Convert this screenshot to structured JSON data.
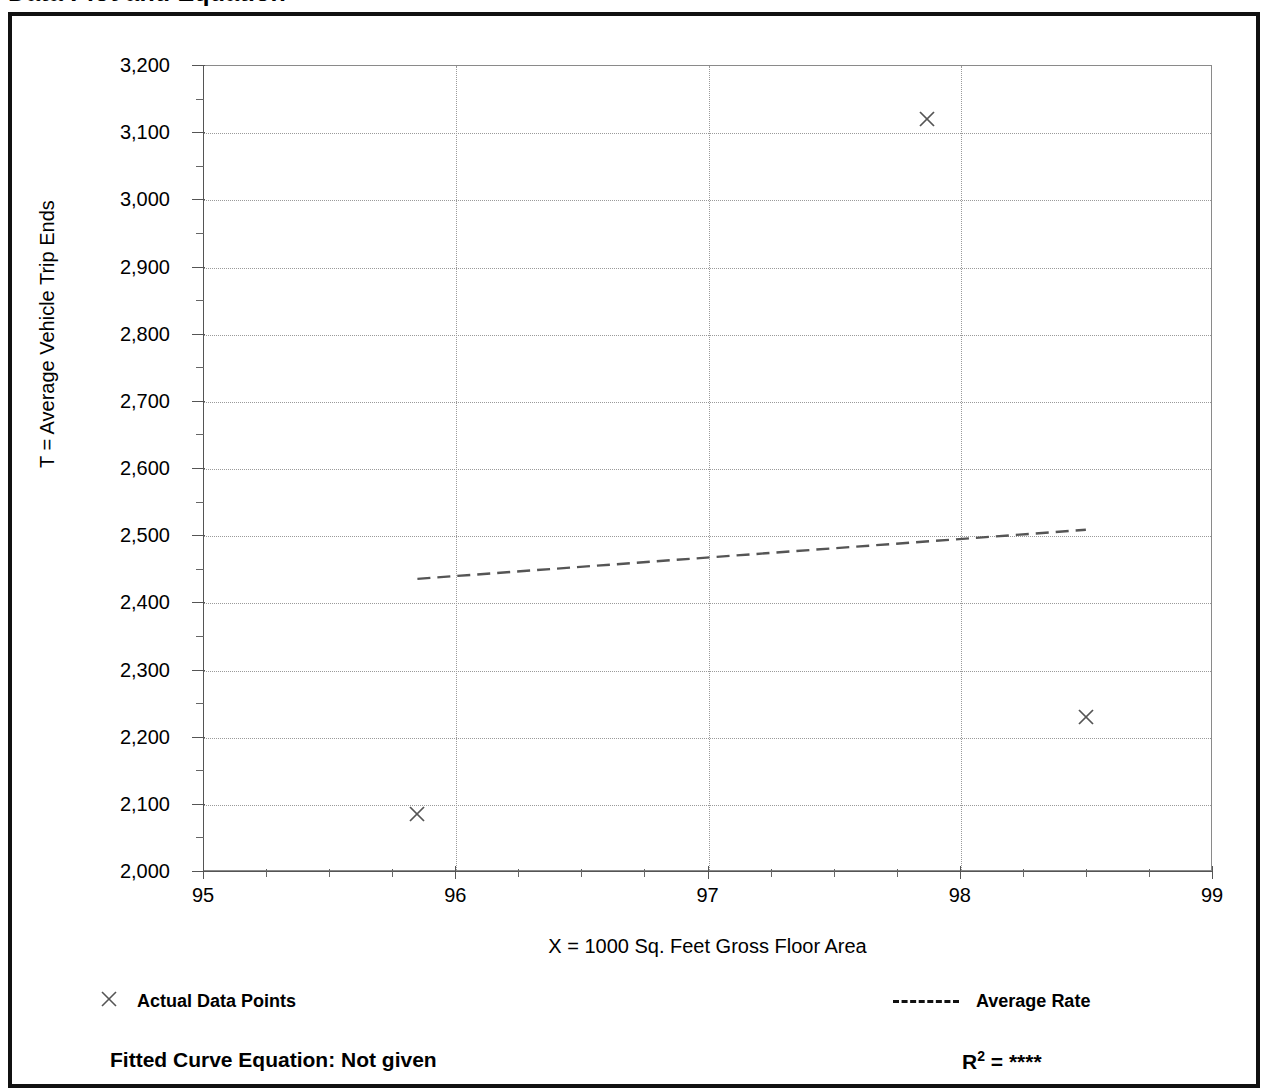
{
  "page": {
    "title": "Data Plot and Equation"
  },
  "chart_data": {
    "type": "scatter",
    "title": "Data Plot and Equation",
    "xlabel": "X = 1000 Sq. Feet Gross Floor Area",
    "ylabel": "T = Average Vehicle Trip Ends",
    "xlim": [
      95,
      99
    ],
    "ylim": [
      2000,
      3200
    ],
    "xticks": [
      "95",
      "96",
      "97",
      "98",
      "99"
    ],
    "yticks": [
      "2,000",
      "2,100",
      "2,200",
      "2,300",
      "2,400",
      "2,500",
      "2,600",
      "2,700",
      "2,800",
      "2,900",
      "3,000",
      "3,100",
      "3,200"
    ],
    "x_minor_tick_interval": 0.25,
    "y_minor_tick_interval": 50,
    "grid": true,
    "legend_position": "below-plot",
    "series": [
      {
        "name": "Actual Data Points",
        "marker": "x",
        "points": [
          {
            "x": 95.85,
            "y": 2085
          },
          {
            "x": 97.87,
            "y": 3120
          },
          {
            "x": 98.5,
            "y": 2230
          }
        ]
      },
      {
        "name": "Average Rate",
        "style": "dashed-line",
        "points": [
          {
            "x": 95.85,
            "y": 2435
          },
          {
            "x": 98.5,
            "y": 2508
          }
        ]
      }
    ],
    "annotations": {
      "fitted_curve_equation": "Fitted Curve Equation:  Not given",
      "r_squared_label": "R",
      "r_squared_exponent": "2",
      "r_squared_value": "= ****"
    }
  },
  "legend": {
    "actual_data_points": "Actual Data Points",
    "average_rate": "Average Rate"
  },
  "footer": {
    "fitted_equation": "Fitted Curve Equation:  Not given",
    "r_label": "R",
    "r_exponent": "2",
    "r_value": "= ****"
  },
  "colors": {
    "ink": "#000000",
    "grid": "#9a9a9a",
    "axis": "#555555",
    "frame": "#111111"
  }
}
